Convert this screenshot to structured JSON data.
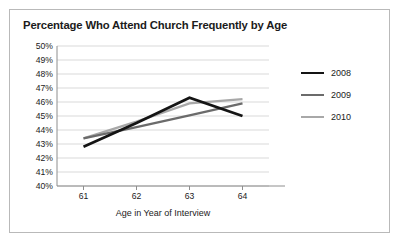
{
  "chart_data": {
    "type": "line",
    "title": "Percentage Who Attend Church Frequently by Age",
    "xlabel": "Age in Year of Interview",
    "ylabel": "",
    "x": [
      61,
      62,
      63,
      64
    ],
    "xticklabels": [
      "61",
      "62",
      "63",
      "64"
    ],
    "yticklabels": [
      "50%",
      "49%",
      "48%",
      "47%",
      "46%",
      "45%",
      "44%",
      "43%",
      "42%",
      "41%",
      "40%"
    ],
    "ylim": [
      40,
      50
    ],
    "ytick_step": 1,
    "xlim": [
      60.5,
      64.5
    ],
    "grid": "horizontal",
    "legend_position": "right",
    "series": [
      {
        "name": "2008",
        "values": [
          42.8,
          44.5,
          46.3,
          45.0
        ],
        "color": "#141414",
        "width": 2.7
      },
      {
        "name": "2009",
        "values": [
          43.4,
          44.2,
          45.05,
          45.9
        ],
        "color": "#6b6b6b",
        "width": 2.3
      },
      {
        "name": "2010",
        "values": [
          43.4,
          44.6,
          45.9,
          46.2
        ],
        "color": "#a8a8a8",
        "width": 2.3
      }
    ]
  },
  "figure": {
    "border_color": "#b9b9b9",
    "background": "#ffffff",
    "gridline_color": "#cfcfcf",
    "axis_color": "#8e8e8e",
    "text_color": "#1b1b1b"
  }
}
